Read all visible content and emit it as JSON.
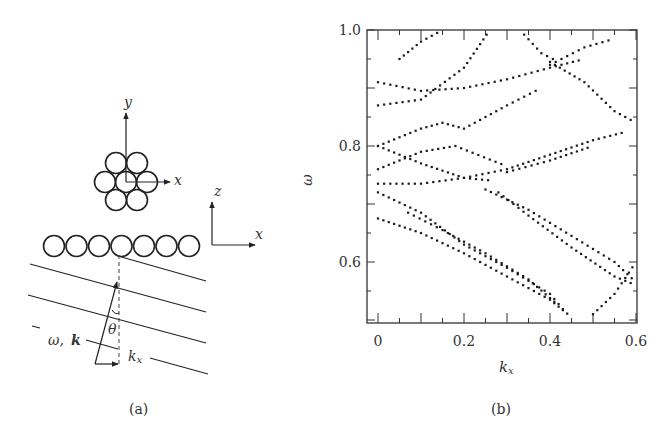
{
  "panel_a": {
    "caption": "(a)",
    "top_view": {
      "axis_x": "x",
      "axis_y": "y",
      "cylinders": 7,
      "arrangement": "hexagonal"
    },
    "side_view": {
      "axis_x": "x",
      "axis_z": "z",
      "cylinders": 7
    },
    "wave_label_omega": "ω,",
    "wave_label_k": "k",
    "angle_label": "θ",
    "kx_label": "k",
    "kx_sub": "x"
  },
  "panel_b": {
    "caption": "(b)",
    "xlabel": "k",
    "xlabel_sub": "x",
    "ylabel": "ω",
    "x_ticks": [
      "0",
      "0.2",
      "0.4",
      "0.6"
    ],
    "y_ticks": [
      "0.6",
      "0.8",
      "1.0"
    ]
  },
  "chart_data": {
    "type": "scatter",
    "title": "",
    "xlabel": "k_x",
    "ylabel": "ω",
    "xlim": [
      -0.02,
      0.6
    ],
    "ylim": [
      0.5,
      1.0
    ],
    "x_ticks": [
      0,
      0.2,
      0.4,
      0.6
    ],
    "y_ticks": [
      0.6,
      0.8,
      1.0
    ],
    "grid": false,
    "legend": null,
    "series": [
      {
        "name": "band A",
        "x": [
          0,
          0.1,
          0.2,
          0.3,
          0.4,
          0.45
        ],
        "y": [
          0.675,
          0.65,
          0.615,
          0.575,
          0.535,
          0.505
        ]
      },
      {
        "name": "band B",
        "x": [
          0,
          0.1,
          0.2,
          0.3,
          0.4,
          0.44
        ],
        "y": [
          0.72,
          0.685,
          0.63,
          0.59,
          0.545,
          0.51
        ]
      },
      {
        "name": "band C",
        "x": [
          0.07,
          0.15,
          0.25,
          0.35,
          0.42
        ],
        "y": [
          0.685,
          0.655,
          0.615,
          0.57,
          0.525
        ]
      },
      {
        "name": "band D",
        "x": [
          0.28,
          0.35,
          0.45,
          0.55,
          0.6
        ],
        "y": [
          0.72,
          0.68,
          0.625,
          0.575,
          0.56
        ]
      },
      {
        "name": "band E",
        "x": [
          0.25,
          0.35,
          0.45,
          0.55,
          0.6
        ],
        "y": [
          0.725,
          0.69,
          0.645,
          0.6,
          0.565
        ]
      },
      {
        "name": "band F",
        "x": [
          0.5,
          0.55,
          0.6
        ],
        "y": [
          0.51,
          0.545,
          0.6
        ]
      },
      {
        "name": "band G",
        "x": [
          0,
          0.1,
          0.2,
          0.3,
          0.4,
          0.5,
          0.58
        ],
        "y": [
          0.735,
          0.735,
          0.745,
          0.76,
          0.785,
          0.81,
          0.825
        ]
      },
      {
        "name": "band H",
        "x": [
          0.3,
          0.4,
          0.5
        ],
        "y": [
          0.755,
          0.775,
          0.8
        ]
      },
      {
        "name": "band I",
        "x": [
          0,
          0.1,
          0.18,
          0.3
        ],
        "y": [
          0.76,
          0.79,
          0.8,
          0.765
        ]
      },
      {
        "name": "band J",
        "x": [
          0,
          0.1,
          0.2,
          0.27
        ],
        "y": [
          0.8,
          0.77,
          0.745,
          0.74
        ]
      },
      {
        "name": "band K",
        "x": [
          0,
          0.1,
          0.15,
          0.2,
          0.3,
          0.38
        ],
        "y": [
          0.8,
          0.83,
          0.84,
          0.83,
          0.87,
          0.9
        ]
      },
      {
        "name": "band L",
        "x": [
          0,
          0.1,
          0.2,
          0.3,
          0.4,
          0.48
        ],
        "y": [
          0.91,
          0.895,
          0.9,
          0.915,
          0.935,
          0.95
        ]
      },
      {
        "name": "band M",
        "x": [
          0.4,
          0.48,
          0.55,
          0.6
        ],
        "y": [
          0.945,
          0.91,
          0.86,
          0.84
        ]
      },
      {
        "name": "band N",
        "x": [
          0,
          0.1,
          0.2,
          0.26
        ],
        "y": [
          0.87,
          0.88,
          0.935,
          1.0
        ]
      },
      {
        "name": "band O",
        "x": [
          0.05,
          0.1,
          0.15
        ],
        "y": [
          0.95,
          0.98,
          1.0
        ]
      },
      {
        "name": "band P",
        "x": [
          0.4,
          0.48,
          0.55
        ],
        "y": [
          0.94,
          0.97,
          0.985
        ]
      },
      {
        "name": "band Q",
        "x": [
          0.33,
          0.38,
          0.42
        ],
        "y": [
          1.0,
          0.96,
          0.945
        ]
      }
    ]
  }
}
